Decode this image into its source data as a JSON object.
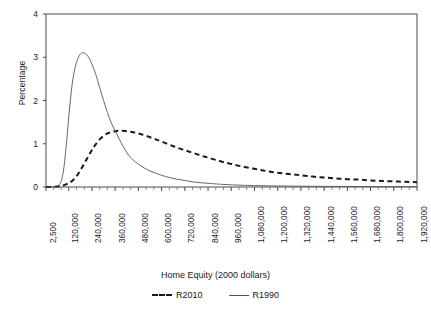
{
  "chart_data": {
    "type": "line",
    "title": "",
    "xlabel": "Home Equity (2000 dollars)",
    "ylabel": "Percentage",
    "ylim": [
      0,
      4
    ],
    "yticks": [
      0,
      1,
      2,
      3,
      4
    ],
    "ytick_labels": [
      "0",
      "1",
      "2",
      "3",
      "4"
    ],
    "grid": false,
    "legend_position": "bottom",
    "xtick_labels": [
      "2,500",
      "120,000",
      "240,000",
      "360,000",
      "480,000",
      "600,000",
      "720,000",
      "840,000",
      "960,000",
      "1,080,000",
      "1,200,000",
      "1,320,000",
      "1,440,000",
      "1,560,000",
      "1,680,000",
      "1,800,000",
      "1,920,000"
    ],
    "xtick_values": [
      2500,
      120000,
      240000,
      360000,
      480000,
      600000,
      720000,
      840000,
      960000,
      1080000,
      1200000,
      1320000,
      1440000,
      1560000,
      1680000,
      1800000,
      1920000
    ],
    "xlim": [
      2500,
      1920000
    ],
    "minor_ticks_per_interval": 3,
    "x": [
      2500,
      30000,
      60000,
      80000,
      95000,
      110000,
      125000,
      140000,
      155000,
      170000,
      185000,
      200000,
      215000,
      230000,
      245000,
      260000,
      280000,
      300000,
      320000,
      340000,
      360000,
      380000,
      400000,
      420000,
      440000,
      460000,
      480000,
      510000,
      540000,
      570000,
      600000,
      640000,
      680000,
      720000,
      760000,
      800000,
      840000,
      900000,
      960000,
      1020000,
      1080000,
      1140000,
      1200000,
      1260000,
      1320000,
      1380000,
      1440000,
      1500000,
      1560000,
      1620000,
      1680000,
      1740000,
      1800000,
      1860000,
      1920000
    ],
    "series": [
      {
        "name": "R2010",
        "style": "dashed",
        "color": "#1a1a1a",
        "values": [
          0.0,
          0.0,
          0.01,
          0.02,
          0.04,
          0.07,
          0.1,
          0.15,
          0.22,
          0.31,
          0.42,
          0.54,
          0.66,
          0.78,
          0.89,
          0.99,
          1.1,
          1.18,
          1.24,
          1.27,
          1.29,
          1.3,
          1.3,
          1.29,
          1.28,
          1.26,
          1.24,
          1.2,
          1.15,
          1.1,
          1.05,
          0.98,
          0.91,
          0.85,
          0.79,
          0.73,
          0.68,
          0.6,
          0.53,
          0.47,
          0.42,
          0.37,
          0.33,
          0.3,
          0.27,
          0.24,
          0.22,
          0.2,
          0.18,
          0.17,
          0.15,
          0.14,
          0.13,
          0.12,
          0.11
        ]
      },
      {
        "name": "R1990",
        "style": "solid",
        "color": "#555555",
        "values": [
          0.0,
          0.0,
          0.02,
          0.12,
          0.45,
          1.1,
          1.85,
          2.45,
          2.8,
          3.0,
          3.09,
          3.1,
          3.05,
          2.94,
          2.78,
          2.6,
          2.3,
          2.0,
          1.72,
          1.48,
          1.3,
          1.12,
          0.95,
          0.8,
          0.68,
          0.6,
          0.53,
          0.44,
          0.37,
          0.32,
          0.27,
          0.22,
          0.18,
          0.15,
          0.12,
          0.1,
          0.085,
          0.065,
          0.05,
          0.04,
          0.033,
          0.028,
          0.024,
          0.021,
          0.018,
          0.016,
          0.014,
          0.013,
          0.012,
          0.011,
          0.01,
          0.009,
          0.008,
          0.008,
          0.007
        ]
      }
    ],
    "legend": [
      {
        "label": "R2010",
        "style": "dashed"
      },
      {
        "label": "R1990",
        "style": "solid"
      }
    ]
  }
}
